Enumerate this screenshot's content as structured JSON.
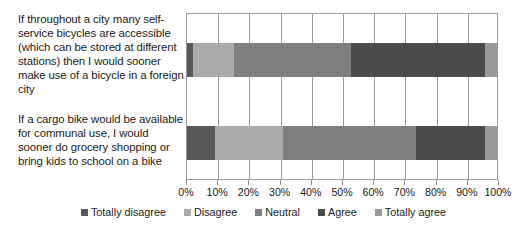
{
  "chart_data": {
    "type": "bar",
    "orientation": "horizontal",
    "stacked": true,
    "stack_mode": "percent",
    "title": "",
    "xlabel": "",
    "ylabel": "",
    "xlim": [
      0,
      100
    ],
    "grid": true,
    "legend_position": "bottom",
    "categories": [
      "If throughout a city many self-service bicycles are accessible (which can be stored at different stations) then I would sooner make use of a bicycle in a foreign city",
      "If a cargo bike would be available for communal use, I would sooner do grocery shopping or bring kids to school on a bike"
    ],
    "category_lines": [
      [
        "If throughout a city many self-",
        "service bicycles are accessible",
        "(which can be stored at different",
        "stations) then I would sooner",
        "make use of a bicycle in a foreign",
        "city"
      ],
      [
        "If a cargo bike would be available",
        "for communal use, I would",
        "sooner do grocery shopping or",
        "bring kids to school on a bike"
      ]
    ],
    "tick_labels": [
      "0%",
      "10%",
      "20%",
      "30%",
      "40%",
      "50%",
      "60%",
      "70%",
      "80%",
      "90%",
      "100%"
    ],
    "tick_values": [
      0,
      10,
      20,
      30,
      40,
      50,
      60,
      70,
      80,
      90,
      100
    ],
    "series": [
      {
        "name": "Totally disagree",
        "color": "#595959",
        "values": [
          2,
          9
        ]
      },
      {
        "name": "Disagree",
        "color": "#ababab",
        "values": [
          13,
          22
        ]
      },
      {
        "name": "Neutral",
        "color": "#7f7f7f",
        "values": [
          38,
          43
        ]
      },
      {
        "name": "Agree",
        "color": "#4a4a4a",
        "values": [
          43,
          22
        ]
      },
      {
        "name": "Totally agree",
        "color": "#9a9a9a",
        "values": [
          4,
          4
        ]
      }
    ]
  },
  "colors": {
    "grid": "#9a9a9a",
    "tick": "#8d8d8d",
    "text": "#1b1b1b",
    "background": "#ffffff"
  }
}
